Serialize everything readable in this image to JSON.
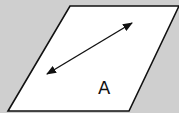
{
  "diagram": {
    "background_color": "#cfcfcf",
    "plane": {
      "fill": "#ffffff",
      "stroke": "#111111",
      "points": [
        [
          70,
          6
        ],
        [
          179,
          6
        ],
        [
          129,
          111
        ],
        [
          8,
          111
        ]
      ]
    },
    "arrow": {
      "type": "double-headed",
      "from": [
        47,
        74
      ],
      "to": [
        132,
        23
      ],
      "color": "#111111"
    },
    "label": {
      "text": "A",
      "position": [
        104,
        94
      ]
    }
  }
}
